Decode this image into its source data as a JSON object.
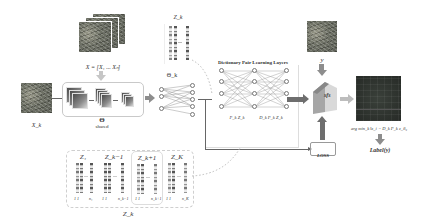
{
  "diagram": {
    "input_stack_label": "X = [X₁ ... Xₙ]",
    "input_single_label": "X_k",
    "shared_symbol": "Θ",
    "shared_label": "shared",
    "theta_k_label": "Θ_k",
    "zk_top_label": "Z_k",
    "dictionary_title": "Dictionary Pair Learning Layers",
    "layer1_label": "P_k Z_k",
    "layer2_label": "D_k P_k Z_k",
    "y_label": "y",
    "sfs_label": "sfs",
    "loss_label": "LOSS",
    "argmin_label": "arg min_k ‖z_i − D_k P_k z_i‖₂",
    "output_label": "Label(y)",
    "bottom_group_label": "Z_k",
    "bottom_groups": [
      {
        "label": "Z₁",
        "sub_left": "1 1",
        "sub_right": "n₁"
      },
      {
        "label": "Z_k−1",
        "sub_left": "1 1",
        "sub_right": "n_k−1"
      },
      {
        "label": "Z_k+1",
        "sub_left": "1 1",
        "sub_right": "n_k+1"
      },
      {
        "label": "Z_K",
        "sub_left": "1 1",
        "sub_right": "n_K"
      }
    ],
    "colors": {
      "arrow": "#8d8d8d",
      "box_border": "#c9c9c9",
      "line": "#666666",
      "output_map": "#2f3530"
    }
  }
}
